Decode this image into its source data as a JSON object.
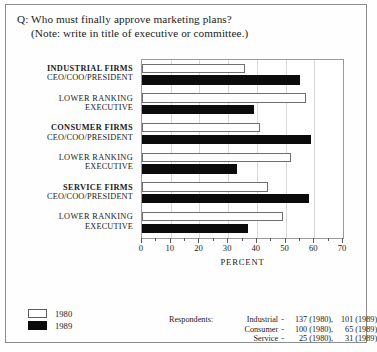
{
  "question": {
    "line1": "Q: Who must finally approve marketing plans?",
    "line2": "(Note: write in title of executive or committee.)"
  },
  "legend": {
    "items": [
      {
        "label": "1980",
        "swatch": "white",
        "color": "#ffffff"
      },
      {
        "label": "1989",
        "swatch": "black",
        "color": "#0b0b0b"
      }
    ]
  },
  "respondents": {
    "label": "Respondents:",
    "rows": [
      {
        "sector": "Industrial",
        "dash": "-",
        "a": "137 (1980),",
        "b": "101 (1989)"
      },
      {
        "sector": "Consumer",
        "dash": "-",
        "a": "100 (1980),",
        "b": "65 (1989)"
      },
      {
        "sector": "Service",
        "dash": "-",
        "a": "25 (1980),",
        "b": "31 (1989)"
      }
    ]
  },
  "chart_data": {
    "type": "bar",
    "orientation": "horizontal",
    "title": "",
    "xlabel": "PERCENT",
    "ylabel": "",
    "xlim": [
      0,
      70
    ],
    "xticks": [
      0,
      10,
      20,
      30,
      40,
      50,
      60,
      70
    ],
    "xtick_labels": [
      "0",
      "10",
      "20",
      "30",
      "40",
      "50",
      "60",
      "70"
    ],
    "minor_tick_step": 5,
    "grid": true,
    "grid_axis": "x",
    "legend_position": "below-left",
    "categories": [
      {
        "line1": "INDUSTRIAL FIRMS",
        "line2": "CEO/COO/PRESIDENT",
        "bold": true
      },
      {
        "line1": "LOWER RANKING",
        "line2": "EXECUTIVE",
        "bold": false
      },
      {
        "line1": "CONSUMER FIRMS",
        "line2": "CEO/COO/PRESIDENT",
        "bold": true
      },
      {
        "line1": "LOWER RANKING",
        "line2": "EXECUTIVE",
        "bold": false
      },
      {
        "line1": "SERVICE FIRMS",
        "line2": "CEO/COO/PRESIDENT",
        "bold": true
      },
      {
        "line1": "LOWER RANKING",
        "line2": "EXECUTIVE",
        "bold": false
      }
    ],
    "series": [
      {
        "name": "1980",
        "color": "#ffffff",
        "values": [
          36,
          57,
          41,
          52,
          44,
          49
        ]
      },
      {
        "name": "1989",
        "color": "#0b0b0b",
        "values": [
          55,
          39,
          59,
          33,
          58,
          37
        ]
      }
    ]
  }
}
